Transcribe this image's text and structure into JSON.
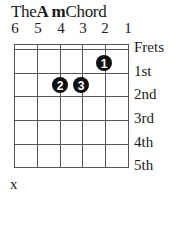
{
  "title": {
    "prefix": "The",
    "chord": "A m",
    "suffix": "Chord"
  },
  "strings": [
    "6",
    "5",
    "4",
    "3",
    "2",
    "1"
  ],
  "fret_header": "Frets",
  "frets": [
    "1st",
    "2nd",
    "3rd",
    "4th",
    "5th"
  ],
  "fingers": [
    {
      "finger": "1",
      "string": 2,
      "fret": 1
    },
    {
      "finger": "2",
      "string": 4,
      "fret": 2
    },
    {
      "finger": "3",
      "string": 3,
      "fret": 2
    }
  ],
  "muted": [
    {
      "string": 6,
      "symbol": "x"
    }
  ]
}
